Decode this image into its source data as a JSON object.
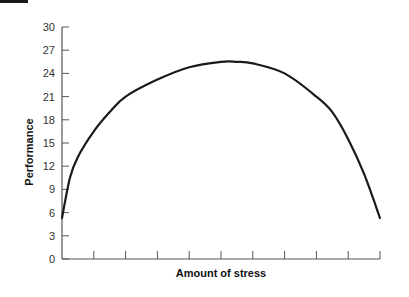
{
  "chart_data": {
    "type": "line",
    "title": "",
    "xlabel": "Amount of stress",
    "ylabel": "Performance",
    "ylim": [
      0,
      30
    ],
    "xlim": [
      0,
      10
    ],
    "yticks": [
      0,
      3,
      6,
      9,
      12,
      15,
      18,
      21,
      24,
      27,
      30
    ],
    "xticks_count": 10,
    "xtick_labels_shown": false,
    "grid": false,
    "legend": null,
    "series": [
      {
        "name": "Performance vs stress",
        "color": "#1a1a1a",
        "x": [
          0,
          0.25,
          0.5,
          1,
          1.5,
          2,
          3,
          4,
          5,
          5.5,
          6,
          7,
          8,
          8.5,
          9,
          9.5,
          10
        ],
        "y": [
          5.3,
          10.5,
          13.2,
          16.5,
          19,
          21,
          23.2,
          24.8,
          25.5,
          25.5,
          25.3,
          24,
          21,
          19,
          15.5,
          11,
          5.3
        ]
      }
    ]
  }
}
